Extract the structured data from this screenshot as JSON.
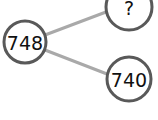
{
  "diagram": {
    "type": "part-whole-model",
    "colors": {
      "line": "#a9a9a9",
      "circle_stroke": "#595959",
      "circle_fill": "#ffffff",
      "text": "#111111"
    },
    "whole": {
      "label": "748"
    },
    "parts": [
      {
        "label": "?"
      },
      {
        "label": "740"
      }
    ]
  }
}
